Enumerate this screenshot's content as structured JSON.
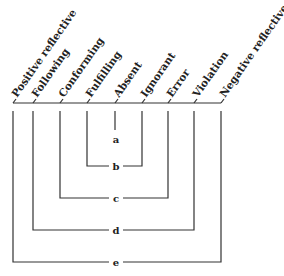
{
  "diagram": {
    "categories": [
      {
        "label": "Positive reflective",
        "x": 13
      },
      {
        "label": "Following",
        "x": 33
      },
      {
        "label": "Conforming",
        "x": 60
      },
      {
        "label": "Fulfilling",
        "x": 87
      },
      {
        "label": "Absent",
        "x": 115
      },
      {
        "label": "Ignorant",
        "x": 142
      },
      {
        "label": "Error",
        "x": 168
      },
      {
        "label": "Violation",
        "x": 194
      },
      {
        "label": "Negative reflective",
        "x": 221
      }
    ],
    "brackets": [
      {
        "label": "a",
        "left": 115,
        "right": 115,
        "y": 139
      },
      {
        "label": "b",
        "left": 87,
        "right": 142,
        "y": 166
      },
      {
        "label": "c",
        "left": 60,
        "right": 168,
        "y": 198
      },
      {
        "label": "d",
        "left": 33,
        "right": 194,
        "y": 230
      },
      {
        "label": "e",
        "left": 13,
        "right": 221,
        "y": 262
      }
    ]
  }
}
